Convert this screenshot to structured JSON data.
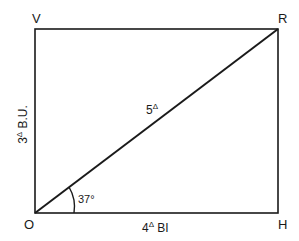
{
  "diagram": {
    "vertices": {
      "top_left": "V",
      "top_right": "R",
      "bottom_left": "O",
      "bottom_right": "H"
    },
    "labels": {
      "diagonal": {
        "base": "5",
        "sup": "Δ"
      },
      "left_side": {
        "base": "3",
        "sup": "Δ",
        "suffix": " B.U."
      },
      "bottom_side": {
        "base": "4",
        "sup": "Δ",
        "suffix": " BI"
      },
      "angle": "37°"
    },
    "colors": {
      "stroke": "#1a1a1a",
      "background": "#ffffff"
    }
  }
}
